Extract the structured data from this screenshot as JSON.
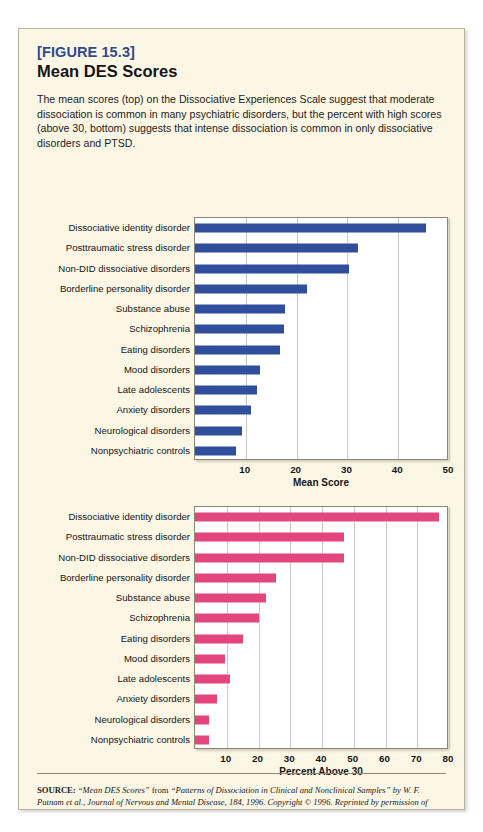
{
  "figure": {
    "number_label": "[FIGURE 15.3]",
    "title": "Mean DES Scores",
    "caption": "The mean scores (top) on the Dissociative Experiences Scale suggest that moderate dissociation is common in many psychiatric disorders, but the percent with high scores (above 30, bottom) suggests that intense dissociation is common in only dissociative disorders and PTSD."
  },
  "colors": {
    "card_background": "#fbf7e4",
    "card_border": "#b9b49c",
    "figure_number": "#2f4a8f",
    "bar_blue": "#2f4f9c",
    "bar_pink": "#e2467d",
    "gridline": "#c9c9cd",
    "plot_background": "#ffffff"
  },
  "source": {
    "label": "SOURCE:",
    "quote1": "“Mean DES Scores”",
    "mid1": " from ",
    "quote2": "“Patterns of Dissociation in Clinical and Nonclinical Samples”",
    "mid2": " by W. F. Putnam et al., Journal of Nervous and Mental Disease, 184, 1996. Copyright © 1996. Reprinted by permission of Lippincott, Williams & Wilkins.",
    "full_text": "SOURCE: “Mean DES Scores” from “Patterns of Dissociation in Clinical and Nonclinical Samples” by W. F. Putnam et al., Journal of Nervous and Mental Disease, 184, 1996. Copyright © 1996. Reprinted by permission of Lippincott, Williams & Wilkins."
  },
  "chart_data": [
    {
      "id": "mean-des-scores",
      "type": "bar",
      "orientation": "horizontal",
      "title": "",
      "xlabel": "Mean Score",
      "ylabel": "",
      "xlim": [
        0,
        50
      ],
      "xticks": [
        10,
        20,
        30,
        40,
        50
      ],
      "grid": true,
      "legend": false,
      "series_color": "#2f4f9c",
      "categories": [
        "Dissociative identity disorder",
        "Posttraumatic stress disorder",
        "Non-DID dissociative disorders",
        "Borderline personality disorder",
        "Substance abuse",
        "Schizophrenia",
        "Eating disorders",
        "Mood disorders",
        "Late adolescents",
        "Anxiety disorders",
        "Neurological disorders",
        "Nonpsychiatric controls"
      ],
      "values": [
        45.5,
        32,
        30.4,
        22,
        17.8,
        17.6,
        16.8,
        12.8,
        12.2,
        11,
        9.2,
        8
      ]
    },
    {
      "id": "percent-above-30",
      "type": "bar",
      "orientation": "horizontal",
      "title": "",
      "xlabel": "Percent Above 30",
      "ylabel": "",
      "xlim": [
        0,
        80
      ],
      "xticks": [
        10,
        20,
        30,
        40,
        50,
        60,
        70,
        80
      ],
      "grid": true,
      "legend": false,
      "series_color": "#e2467d",
      "categories": [
        "Dissociative identity disorder",
        "Posttraumatic stress disorder",
        "Non-DID dissociative disorders",
        "Borderline personality disorder",
        "Substance abuse",
        "Schizophrenia",
        "Eating disorders",
        "Mood disorders",
        "Late adolescents",
        "Anxiety disorders",
        "Neurological disorders",
        "Nonpsychiatric controls"
      ],
      "values": [
        77,
        47,
        47,
        25.5,
        22.5,
        20,
        15,
        9.5,
        11,
        7,
        4.5,
        4.5
      ]
    }
  ]
}
